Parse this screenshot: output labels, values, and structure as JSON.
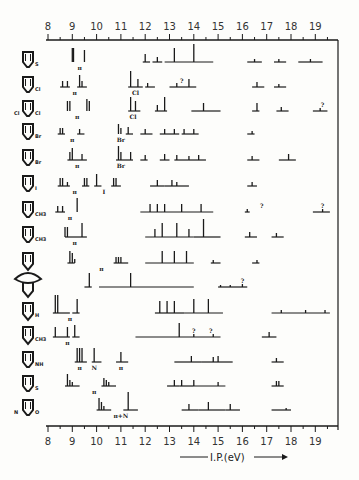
{
  "chart_data": {
    "type": "stick-spectrum",
    "title": "",
    "xlabel": "I.P.(eV)",
    "ylabel": "",
    "xlim": [
      8,
      19.6
    ],
    "x_ticks": [
      8,
      9,
      10,
      11,
      12,
      13,
      14,
      15,
      16,
      17,
      18,
      19
    ],
    "grid": false,
    "axes": {
      "top": true,
      "bottom": true,
      "right_frame": true
    },
    "rows": [
      {
        "molecule": "thiophene",
        "substituent": "S",
        "sticks": [
          [
            9.0,
            14
          ],
          [
            9.05,
            14
          ],
          [
            9.5,
            12
          ],
          [
            12.0,
            8
          ],
          [
            12.5,
            5
          ],
          [
            13.2,
            14
          ],
          [
            14.0,
            18
          ],
          [
            16.5,
            3
          ],
          [
            17.5,
            3
          ],
          [
            18.8,
            3
          ]
        ],
        "bands": [
          [
            11.9,
            12.2
          ],
          [
            12.3,
            12.7
          ],
          [
            12.8,
            14.8
          ],
          [
            16.2,
            16.8
          ],
          [
            17.3,
            17.8
          ],
          [
            18.3,
            19.3
          ]
        ],
        "annotations": [
          {
            "x": 9.3,
            "text": "π"
          }
        ]
      },
      {
        "molecule": "2-chlorothiophene",
        "substituent": "Cl",
        "sticks": [
          [
            8.6,
            6
          ],
          [
            8.8,
            6
          ],
          [
            9.3,
            12
          ],
          [
            9.4,
            6
          ],
          [
            11.4,
            16
          ],
          [
            11.7,
            8
          ],
          [
            12.1,
            4
          ],
          [
            13.3,
            4
          ],
          [
            13.8,
            8
          ],
          [
            16.6,
            5
          ],
          [
            17.5,
            3
          ]
        ],
        "bands": [
          [
            8.5,
            8.9
          ],
          [
            9.2,
            9.6
          ],
          [
            11.3,
            11.9
          ],
          [
            12.0,
            12.4
          ],
          [
            13.0,
            14.1
          ],
          [
            16.4,
            16.9
          ],
          [
            17.3,
            17.8
          ]
        ],
        "annotations": [
          {
            "x": 9.1,
            "text": "π"
          },
          {
            "x": 11.6,
            "text": "Cl"
          },
          {
            "x": 13.5,
            "text": "?"
          }
        ]
      },
      {
        "molecule": "2,5-dichlorothiophene",
        "substituent": "Cl / Cl",
        "sticks": [
          [
            8.8,
            10
          ],
          [
            8.9,
            10
          ],
          [
            9.6,
            12
          ],
          [
            9.7,
            10
          ],
          [
            11.4,
            14
          ],
          [
            11.6,
            10
          ],
          [
            12.5,
            6
          ],
          [
            12.8,
            14
          ],
          [
            14.4,
            8
          ],
          [
            16.6,
            8
          ],
          [
            17.6,
            4
          ],
          [
            19.2,
            3
          ]
        ],
        "bands": [
          [
            11.3,
            11.8
          ],
          [
            12.4,
            12.9
          ],
          [
            13.9,
            15.1
          ],
          [
            16.4,
            16.7
          ],
          [
            17.4,
            17.9
          ],
          [
            18.9,
            19.5
          ]
        ],
        "annotations": [
          {
            "x": 9.2,
            "text": "π"
          },
          {
            "x": 11.5,
            "text": "Cl"
          },
          {
            "x": 19.3,
            "text": "?"
          }
        ]
      },
      {
        "molecule": "2-bromothiophene",
        "substituent": "Br",
        "sticks": [
          [
            8.5,
            6
          ],
          [
            8.6,
            6
          ],
          [
            9.3,
            5
          ],
          [
            10.9,
            10
          ],
          [
            11.0,
            6
          ],
          [
            11.3,
            7
          ],
          [
            12.0,
            5
          ],
          [
            12.8,
            5
          ],
          [
            13.2,
            5
          ],
          [
            13.6,
            5
          ],
          [
            14.0,
            5
          ],
          [
            16.4,
            3
          ]
        ],
        "bands": [
          [
            8.4,
            8.7
          ],
          [
            9.2,
            9.5
          ],
          [
            11.2,
            11.5
          ],
          [
            11.8,
            12.3
          ],
          [
            12.6,
            13.4
          ],
          [
            13.5,
            14.2
          ],
          [
            16.2,
            16.5
          ]
        ],
        "annotations": [
          {
            "x": 9.0,
            "text": "π"
          },
          {
            "x": 11.0,
            "text": "Br"
          }
        ]
      },
      {
        "molecule": "3-bromothiophene",
        "substituent": "Br",
        "sticks": [
          [
            8.9,
            8
          ],
          [
            9.0,
            12
          ],
          [
            9.4,
            6
          ],
          [
            10.9,
            14
          ],
          [
            11.0,
            8
          ],
          [
            11.4,
            8
          ],
          [
            12.0,
            5
          ],
          [
            12.8,
            6
          ],
          [
            13.3,
            5
          ],
          [
            13.8,
            4
          ],
          [
            14.2,
            5
          ],
          [
            16.4,
            4
          ],
          [
            17.9,
            6
          ]
        ],
        "bands": [
          [
            8.8,
            9.6
          ],
          [
            10.8,
            11.5
          ],
          [
            11.8,
            12.1
          ],
          [
            12.6,
            13.0
          ],
          [
            13.2,
            13.8
          ],
          [
            13.8,
            14.5
          ],
          [
            16.2,
            16.7
          ],
          [
            17.5,
            18.2
          ]
        ],
        "annotations": [
          {
            "x": 9.2,
            "text": "π"
          },
          {
            "x": 11.0,
            "text": "Br"
          }
        ]
      },
      {
        "molecule": "2-iodothiophene",
        "substituent": "I",
        "sticks": [
          [
            8.5,
            8
          ],
          [
            8.6,
            8
          ],
          [
            8.8,
            4
          ],
          [
            9.5,
            8
          ],
          [
            9.6,
            8
          ],
          [
            10.0,
            12
          ],
          [
            10.7,
            8
          ],
          [
            10.8,
            8
          ],
          [
            12.5,
            6
          ],
          [
            13.1,
            6
          ],
          [
            13.3,
            4
          ],
          [
            16.4,
            4
          ]
        ],
        "bands": [
          [
            8.4,
            8.9
          ],
          [
            9.4,
            9.7
          ],
          [
            9.9,
            10.2
          ],
          [
            10.6,
            11.0
          ],
          [
            12.2,
            12.8
          ],
          [
            12.8,
            13.8
          ],
          [
            16.2,
            16.6
          ]
        ],
        "annotations": [
          {
            "x": 9.1,
            "text": "π"
          },
          {
            "x": 10.3,
            "text": "I"
          }
        ]
      },
      {
        "molecule": "2-methylthiophene",
        "substituent": "CH3",
        "sticks": [
          [
            8.4,
            6
          ],
          [
            8.6,
            6
          ],
          [
            9.2,
            14
          ],
          [
            12.2,
            8
          ],
          [
            12.5,
            8
          ],
          [
            12.8,
            8
          ],
          [
            13.5,
            8
          ],
          [
            14.3,
            8
          ],
          [
            16.2,
            3
          ],
          [
            19.3,
            3
          ]
        ],
        "bands": [
          [
            8.3,
            8.7
          ],
          [
            11.8,
            14.8
          ],
          [
            16.1,
            16.3
          ],
          [
            18.9,
            19.6
          ]
        ],
        "annotations": [
          {
            "x": 8.9,
            "text": "π"
          },
          {
            "x": 16.8,
            "text": "?"
          },
          {
            "x": 19.3,
            "text": "?"
          }
        ]
      },
      {
        "molecule": "3-methylthiophene",
        "substituent": "CH3",
        "sticks": [
          [
            8.7,
            10
          ],
          [
            8.8,
            10
          ],
          [
            9.4,
            14
          ],
          [
            12.4,
            8
          ],
          [
            12.7,
            14
          ],
          [
            13.3,
            14
          ],
          [
            13.8,
            8
          ],
          [
            14.4,
            18
          ],
          [
            16.3,
            5
          ],
          [
            17.4,
            4
          ]
        ],
        "bands": [
          [
            8.7,
            9.6
          ],
          [
            12.0,
            14.0
          ],
          [
            14.0,
            15.1
          ],
          [
            16.1,
            16.6
          ],
          [
            17.2,
            17.7
          ]
        ],
        "annotations": [
          {
            "x": 9.1,
            "text": "π"
          }
        ]
      },
      {
        "molecule": "cyclopentadiene-like ring",
        "substituent": "",
        "sticks": [
          [
            8.9,
            12
          ],
          [
            9.0,
            10
          ],
          [
            9.1,
            4
          ],
          [
            10.8,
            6
          ],
          [
            10.9,
            6
          ],
          [
            11.0,
            6
          ],
          [
            12.7,
            12
          ],
          [
            13.2,
            12
          ],
          [
            13.7,
            12
          ],
          [
            14.8,
            3
          ],
          [
            16.6,
            3
          ]
        ],
        "bands": [
          [
            8.8,
            9.1
          ],
          [
            10.7,
            11.3
          ],
          [
            12.0,
            14.0
          ],
          [
            14.7,
            15.1
          ],
          [
            16.4,
            16.7
          ]
        ],
        "annotations": [
          {
            "x": 10.2,
            "text": "π"
          }
        ]
      },
      {
        "molecule": "bicyclic compound",
        "substituent": "",
        "sticks": [
          [
            9.7,
            14
          ],
          [
            11.4,
            14
          ],
          [
            15.1,
            2
          ],
          [
            15.5,
            2
          ],
          [
            16.0,
            3
          ]
        ],
        "bands": [
          [
            9.5,
            9.8
          ],
          [
            10.1,
            14.0
          ],
          [
            15.0,
            16.2
          ]
        ],
        "annotations": [
          {
            "x": 16.0,
            "text": "?"
          }
        ]
      },
      {
        "molecule": "pyrrole",
        "substituent": "H",
        "sticks": [
          [
            8.3,
            18
          ],
          [
            8.4,
            18
          ],
          [
            9.2,
            14
          ],
          [
            12.6,
            12
          ],
          [
            12.9,
            12
          ],
          [
            13.2,
            12
          ],
          [
            14.0,
            14
          ],
          [
            14.6,
            14
          ],
          [
            17.6,
            3
          ],
          [
            18.6,
            3
          ],
          [
            19.4,
            3
          ]
        ],
        "bands": [
          [
            8.2,
            8.9
          ],
          [
            9.0,
            9.3
          ],
          [
            12.4,
            13.6
          ],
          [
            13.6,
            15.2
          ],
          [
            17.2,
            19.6
          ]
        ],
        "annotations": [
          {
            "x": 8.9,
            "text": "π"
          }
        ]
      },
      {
        "molecule": "N-methylpyrrole",
        "substituent": "CH3",
        "sticks": [
          [
            8.3,
            10
          ],
          [
            8.8,
            10
          ],
          [
            9.1,
            12
          ],
          [
            13.4,
            14
          ],
          [
            14.0,
            3
          ],
          [
            14.8,
            3
          ],
          [
            17.1,
            5
          ]
        ],
        "bands": [
          [
            8.2,
            8.9
          ],
          [
            9.0,
            9.3
          ],
          [
            11.6,
            15.1
          ],
          [
            16.8,
            17.4
          ]
        ],
        "annotations": [
          {
            "x": 8.8,
            "text": "π"
          },
          {
            "x": 14.0,
            "text": "?"
          },
          {
            "x": 14.7,
            "text": "?"
          }
        ]
      },
      {
        "molecule": "cyclic amine (NH)",
        "substituent": "NH",
        "sticks": [
          [
            9.2,
            14
          ],
          [
            9.3,
            14
          ],
          [
            9.4,
            14
          ],
          [
            9.9,
            14
          ],
          [
            11.0,
            10
          ],
          [
            13.9,
            6
          ],
          [
            14.8,
            5
          ],
          [
            15.0,
            6
          ],
          [
            17.4,
            4
          ]
        ],
        "bands": [
          [
            9.1,
            9.6
          ],
          [
            9.8,
            10.2
          ],
          [
            10.8,
            11.3
          ],
          [
            13.2,
            14.3
          ],
          [
            14.3,
            15.6
          ],
          [
            17.2,
            17.7
          ]
        ],
        "annotations": [
          {
            "x": 9.3,
            "text": "π"
          },
          {
            "x": 9.9,
            "text": "N"
          },
          {
            "x": 11.0,
            "text": "π"
          }
        ]
      },
      {
        "molecule": "thiophene derivative (S)",
        "substituent": "S",
        "sticks": [
          [
            8.8,
            12
          ],
          [
            8.9,
            6
          ],
          [
            9.0,
            4
          ],
          [
            10.3,
            8
          ],
          [
            10.4,
            6
          ],
          [
            10.5,
            4
          ],
          [
            13.2,
            6
          ],
          [
            13.5,
            6
          ],
          [
            14.0,
            6
          ],
          [
            15.0,
            4
          ],
          [
            17.4,
            5
          ],
          [
            17.5,
            5
          ]
        ],
        "bands": [
          [
            8.7,
            9.3
          ],
          [
            10.2,
            10.8
          ],
          [
            12.9,
            13.4
          ],
          [
            13.4,
            14.0
          ],
          [
            14.0,
            15.3
          ],
          [
            17.2,
            17.7
          ]
        ],
        "annotations": [
          {
            "x": 9.9,
            "text": "π"
          }
        ]
      },
      {
        "molecule": "oxazole-type (N,O)",
        "substituent": "N / O",
        "sticks": [
          [
            10.1,
            12
          ],
          [
            10.2,
            8
          ],
          [
            10.3,
            4
          ],
          [
            11.3,
            18
          ],
          [
            13.8,
            6
          ],
          [
            14.6,
            8
          ],
          [
            15.5,
            6
          ],
          [
            17.8,
            2
          ]
        ],
        "bands": [
          [
            10.0,
            10.6
          ],
          [
            11.1,
            11.7
          ],
          [
            13.5,
            14.2
          ],
          [
            14.2,
            15.3
          ],
          [
            15.3,
            15.9
          ],
          [
            17.2,
            18.0
          ]
        ],
        "annotations": [
          {
            "x": 11.0,
            "text": "π+N"
          }
        ]
      }
    ],
    "legend": []
  },
  "axis": {
    "top_ticks": [
      "8",
      "9",
      "10",
      "11",
      "12",
      "13",
      "14",
      "15",
      "16",
      "17",
      "18",
      "19"
    ],
    "bottom_ticks": [
      "8",
      "9",
      "10",
      "11",
      "12",
      "13",
      "14",
      "15",
      "16",
      "17",
      "18",
      "19"
    ],
    "xlabel": "I.P.(eV)",
    "arrow": "→"
  },
  "colors": {
    "ink": "#1a1a1a",
    "paper": "#fdfdfb"
  }
}
